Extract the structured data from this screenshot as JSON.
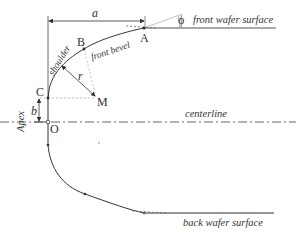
{
  "diagram": {
    "type": "wafer edge profile",
    "points": {
      "A": "A",
      "B": "B",
      "C": "C",
      "M": "M",
      "O": "O"
    },
    "dimensions": {
      "a": "a",
      "b": "b",
      "r": "r",
      "phi": "ϕ"
    },
    "labels": {
      "front_surface": "front wafer surface",
      "back_surface": "back wafer surface",
      "centerline": "centerline",
      "shoulder": "shoulder",
      "front_bevel": "front bevel",
      "apex": "Apex"
    },
    "colors": {
      "stroke": "#333333",
      "guide": "#999999"
    }
  }
}
